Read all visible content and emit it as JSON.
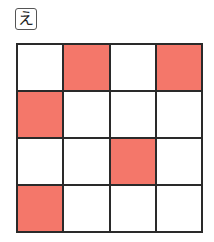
{
  "label": "え",
  "grid": {
    "rows": 4,
    "cols": 4,
    "fill_color": "#f4776a",
    "cells": [
      [
        0,
        1,
        0,
        1
      ],
      [
        1,
        0,
        0,
        0
      ],
      [
        0,
        0,
        1,
        0
      ],
      [
        1,
        0,
        0,
        0
      ]
    ]
  }
}
